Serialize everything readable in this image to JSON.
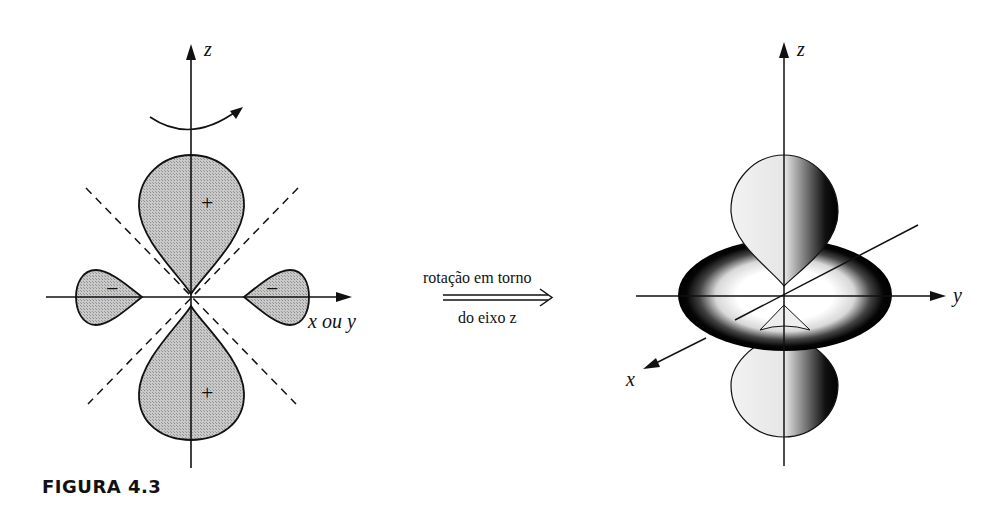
{
  "figure": {
    "caption": "FIGURA 4.3",
    "left_diagram": {
      "z_axis_label": "z",
      "horizontal_axis_label": "x ou y",
      "lobe_signs": {
        "top": "+",
        "bottom": "+",
        "left": "−",
        "right": "−"
      },
      "rotation_arrow": "curved arrow around z axis",
      "nodal_lines": "dashed diagonals"
    },
    "transform": {
      "label_top": "rotação em torno",
      "label_bottom": "do eixo z",
      "arrow": "double arrow (⇒)"
    },
    "right_diagram": {
      "z_axis_label": "z",
      "y_axis_label": "y",
      "x_axis_label": "x",
      "description": "3D dz² orbital: two lobes along z with a torus in the xy plane"
    }
  }
}
